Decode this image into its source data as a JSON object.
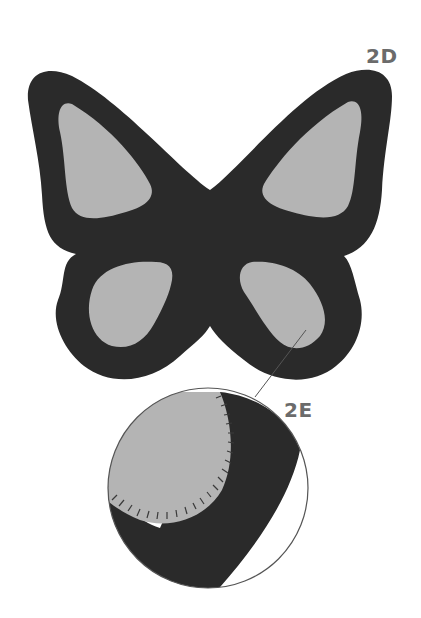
{
  "figure": {
    "labels": {
      "step_2d": "2D",
      "step_2e": "2E"
    },
    "colors": {
      "felt_dark": "#2a2a2a",
      "felt_light": "#b4b4b4",
      "stitch": "#3a3a3a",
      "leader_line": "#555555",
      "label_gray": "#6b6b6b",
      "background": "#ffffff"
    },
    "parts": {
      "butterfly": "butterfly-felt-shape",
      "magnifier": "detail-magnifier-circle",
      "stitches": "blanket-stitch-detail"
    }
  }
}
